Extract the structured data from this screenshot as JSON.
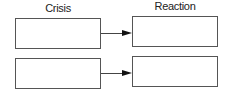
{
  "headers": {
    "left": "Crisis",
    "right": "Reaction"
  },
  "rows": [
    {
      "crisis": "",
      "reaction": ""
    },
    {
      "crisis": "",
      "reaction": ""
    }
  ]
}
